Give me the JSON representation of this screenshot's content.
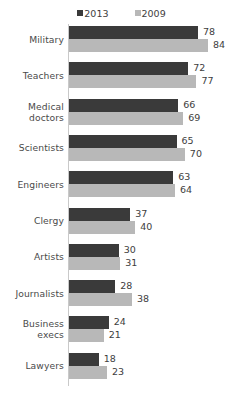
{
  "chart_data": {
    "type": "bar",
    "orientation": "horizontal",
    "title": "",
    "subtitle": "",
    "xlabel": "",
    "ylabel": "",
    "xlim": [
      0,
      100
    ],
    "grid": false,
    "legend_position": "top-center",
    "categories": [
      "Military",
      "Teachers",
      "Medical doctors",
      "Scientists",
      "Engineers",
      "Clergy",
      "Artists",
      "Journalists",
      "Business execs",
      "Lawyers"
    ],
    "category_lines": [
      [
        "Military"
      ],
      [
        "Teachers"
      ],
      [
        "Medical",
        "doctors"
      ],
      [
        "Scientists"
      ],
      [
        "Engineers"
      ],
      [
        "Clergy"
      ],
      [
        "Artists"
      ],
      [
        "Journalists"
      ],
      [
        "Business",
        "execs"
      ],
      [
        "Lawyers"
      ]
    ],
    "series": [
      {
        "name": "2013",
        "color": "#3a3a3a",
        "values": [
          78,
          72,
          66,
          65,
          63,
          37,
          30,
          28,
          24,
          18
        ]
      },
      {
        "name": "2009",
        "color": "#b8b8b8",
        "values": [
          84,
          77,
          69,
          70,
          64,
          40,
          31,
          38,
          21,
          23
        ]
      }
    ]
  },
  "legend": {
    "items": [
      {
        "label": "2013",
        "color": "#3a3a3a"
      },
      {
        "label": "2009",
        "color": "#b8b8b8"
      }
    ]
  },
  "colors": {
    "series_2013": "#3a3a3a",
    "series_2009": "#b8b8b8",
    "axis_line": "#c9c9c9",
    "text": "#4a4a4a",
    "background": "#ffffff"
  }
}
